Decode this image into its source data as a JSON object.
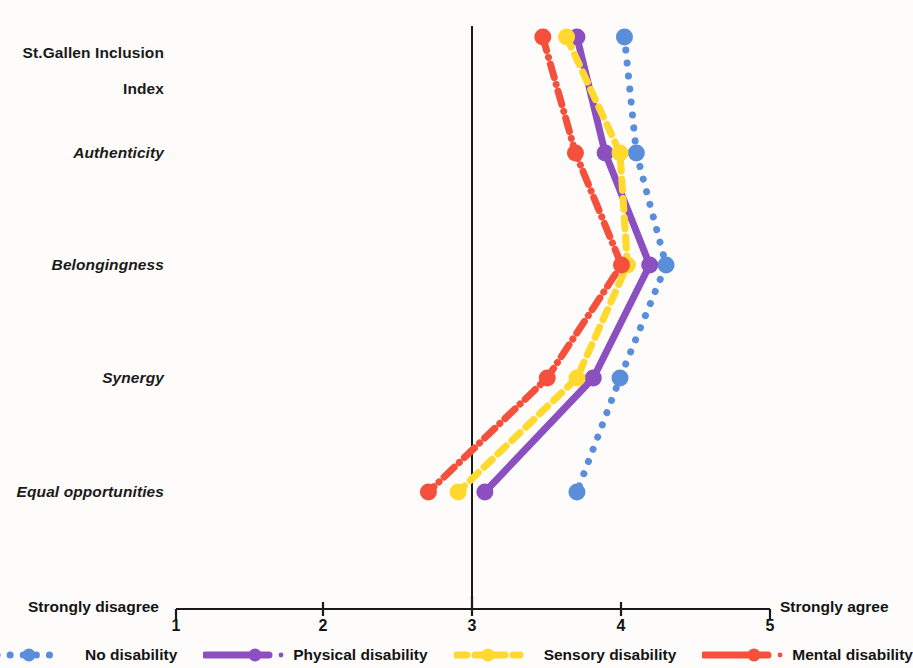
{
  "chart_data": {
    "type": "line",
    "orientation": "horizontal",
    "title": "",
    "xlabel": "",
    "ylabel": "",
    "xlim": [
      1,
      5
    ],
    "xticks": [
      1,
      2,
      3,
      4,
      5
    ],
    "xtick_labels": [
      "1",
      "2",
      "3",
      "4",
      "5"
    ],
    "axis_anchor_low": "Strongly disagree",
    "axis_anchor_high": "Strongly agree",
    "grid": false,
    "reference_line_x": 3,
    "legend_position": "bottom",
    "categories": [
      "St.Gallen Inclusion\nIndex",
      "Authenticity",
      "Belongingness",
      "Synergy",
      "Equal opportunities"
    ],
    "category_labels_plain": [
      "St.Gallen Inclusion Index",
      "Authenticity",
      "Belongingness",
      "Synergy",
      "Equal opportunities"
    ],
    "series": [
      {
        "name": "No disability",
        "color": "#5a8edb",
        "line_style": "dotted",
        "values": [
          4.02,
          4.1,
          4.3,
          3.99,
          3.7
        ]
      },
      {
        "name": "Physical disability",
        "color": "#8b4fbf",
        "line_style": "solid",
        "values": [
          3.7,
          3.89,
          4.19,
          3.81,
          3.08
        ]
      },
      {
        "name": "Sensory disability",
        "color": "#ffd92e",
        "line_style": "dashed",
        "values": [
          3.63,
          3.99,
          4.04,
          3.7,
          2.9
        ]
      },
      {
        "name": "Mental disability",
        "color": "#f4503c",
        "line_style": "dash-dot",
        "values": [
          3.47,
          3.69,
          4.0,
          3.5,
          2.7
        ]
      }
    ]
  },
  "legend": {
    "items": [
      {
        "label": "No disability",
        "color": "#5a8edb",
        "style": "dotted"
      },
      {
        "label": "Physical disability",
        "color": "#8b4fbf",
        "style": "solid"
      },
      {
        "label": "Sensory disability",
        "color": "#ffd92e",
        "style": "dashed"
      },
      {
        "label": "Mental disability",
        "color": "#f4503c",
        "style": "dashdot"
      }
    ]
  },
  "axis": {
    "low_anchor": "Strongly disagree",
    "high_anchor": "Strongly agree",
    "tick_1": "1",
    "tick_2": "2",
    "tick_3": "3",
    "tick_4": "4",
    "tick_5": "5"
  },
  "y_labels": {
    "index_line1": "St.Gallen Inclusion",
    "index_line2": "Index",
    "authenticity": "Authenticity",
    "belongingness": "Belongingness",
    "synergy": "Synergy",
    "equal_opportunities": "Equal opportunities"
  }
}
